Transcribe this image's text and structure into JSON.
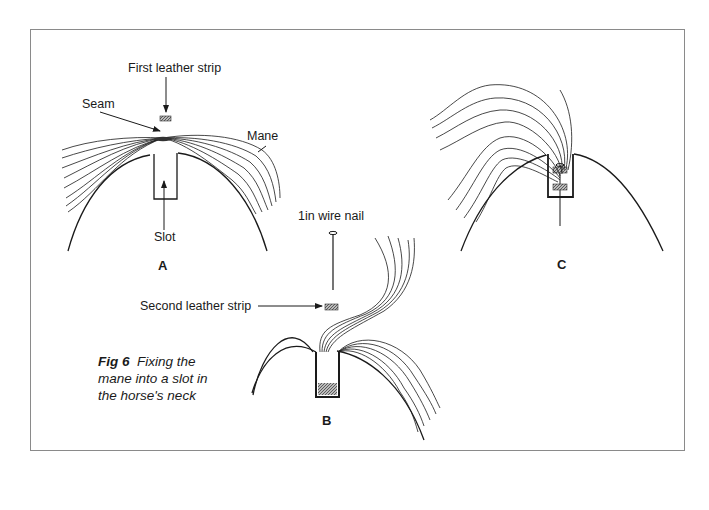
{
  "figure": {
    "caption_number": "Fig 6",
    "caption_text": "Fixing the mane into a slot in the horse's neck"
  },
  "panels": [
    {
      "letter": "A",
      "labels": {
        "first_strip": "First leather strip",
        "seam": "Seam",
        "mane": "Mane",
        "slot": "Slot"
      }
    },
    {
      "letter": "B",
      "labels": {
        "nail": "1in wire nail",
        "second_strip": "Second leather strip"
      }
    },
    {
      "letter": "C",
      "labels": {}
    }
  ],
  "colors": {
    "ink": "#1a1a1a",
    "frame": "#8a8a8a",
    "hatch": "#777777"
  }
}
